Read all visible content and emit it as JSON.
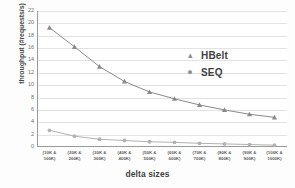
{
  "chart_data": {
    "type": "line",
    "title": "",
    "xlabel": "delta sizes",
    "ylabel": "throughput (#requests/s)",
    "categories": [
      "(10K & 100K)",
      "(20K & 200K)",
      "(30K & 300K)",
      "(40K & 400K)",
      "(50K & 500K)",
      "(60K & 600K)",
      "(70K & 700K)",
      "(80K & 800K)",
      "(90K & 900K)",
      "(100K & 1000K)"
    ],
    "category_lines": [
      [
        "(10K &",
        "100K)"
      ],
      [
        "(20K &",
        "200K)"
      ],
      [
        "(30K &",
        "300K)"
      ],
      [
        "(40K &",
        "400K)"
      ],
      [
        "(50K &",
        "500K)"
      ],
      [
        "(60K &",
        "600K)"
      ],
      [
        "(70K &",
        "700K)"
      ],
      [
        "(80K &",
        "800K)"
      ],
      [
        "(90K &",
        "900K)"
      ],
      [
        "(100K &",
        "1000K)"
      ]
    ],
    "series": [
      {
        "name": "HBelt",
        "marker": "triangle",
        "color": "#8a8a8a",
        "values": [
          19.3,
          16.2,
          13.0,
          10.6,
          8.9,
          7.8,
          6.8,
          6.0,
          5.3,
          4.8
        ]
      },
      {
        "name": "SEQ",
        "marker": "circle",
        "color": "#b2b2b2",
        "values": [
          2.7,
          1.75,
          1.25,
          1.05,
          0.85,
          0.75,
          0.6,
          0.5,
          0.4,
          0.3
        ]
      }
    ],
    "ylim": [
      0,
      22
    ],
    "yticks": [
      0,
      2,
      4,
      6,
      8,
      10,
      12,
      14,
      16,
      18,
      20,
      22
    ],
    "grid": true,
    "legend_position": "center-right",
    "legend": [
      "HBelt",
      "SEQ"
    ],
    "colors": {
      "hbelt": "#8a8a8a",
      "seq": "#b2b2b2",
      "gridline": "#e2e2e2",
      "axis": "#9a9a9a",
      "text": "#5a5a5a",
      "background": "#ffffff"
    }
  }
}
